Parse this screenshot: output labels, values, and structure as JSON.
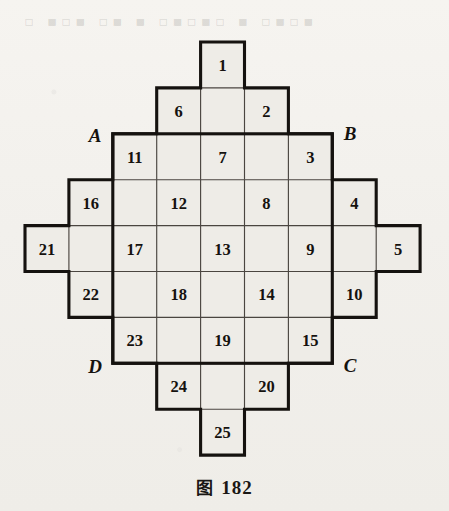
{
  "figure": {
    "caption_prefix": "图",
    "caption_number": "182",
    "ghost_text": "▫ ▪▫▪ ▫▪ ▪ ▫▪▫▪▫ ▪ ▫▪▫▪",
    "grid": {
      "columns": 9,
      "rows": 9,
      "cell_width": 43.9,
      "cell_height": 45.9,
      "origin_x": 25,
      "origin_y": 42,
      "row_spans": [
        {
          "row": 1,
          "col_start": 5,
          "col_end": 5
        },
        {
          "row": 2,
          "col_start": 4,
          "col_end": 6
        },
        {
          "row": 3,
          "col_start": 3,
          "col_end": 7
        },
        {
          "row": 4,
          "col_start": 2,
          "col_end": 8
        },
        {
          "row": 5,
          "col_start": 1,
          "col_end": 9
        },
        {
          "row": 6,
          "col_start": 2,
          "col_end": 8
        },
        {
          "row": 7,
          "col_start": 3,
          "col_end": 7
        },
        {
          "row": 8,
          "col_start": 4,
          "col_end": 6
        },
        {
          "row": 9,
          "col_start": 5,
          "col_end": 5
        }
      ]
    },
    "numbered_cells": [
      {
        "label": "1",
        "row": 1,
        "col": 5
      },
      {
        "label": "6",
        "row": 2,
        "col": 4
      },
      {
        "label": "2",
        "row": 2,
        "col": 6
      },
      {
        "label": "11",
        "row": 3,
        "col": 3
      },
      {
        "label": "7",
        "row": 3,
        "col": 5
      },
      {
        "label": "3",
        "row": 3,
        "col": 7
      },
      {
        "label": "16",
        "row": 4,
        "col": 2
      },
      {
        "label": "12",
        "row": 4,
        "col": 4
      },
      {
        "label": "8",
        "row": 4,
        "col": 6
      },
      {
        "label": "4",
        "row": 4,
        "col": 8
      },
      {
        "label": "21",
        "row": 5,
        "col": 1
      },
      {
        "label": "17",
        "row": 5,
        "col": 3
      },
      {
        "label": "13",
        "row": 5,
        "col": 5
      },
      {
        "label": "9",
        "row": 5,
        "col": 7
      },
      {
        "label": "5",
        "row": 5,
        "col": 9
      },
      {
        "label": "22",
        "row": 6,
        "col": 2
      },
      {
        "label": "18",
        "row": 6,
        "col": 4
      },
      {
        "label": "14",
        "row": 6,
        "col": 6
      },
      {
        "label": "10",
        "row": 6,
        "col": 8
      },
      {
        "label": "23",
        "row": 7,
        "col": 3
      },
      {
        "label": "19",
        "row": 7,
        "col": 5
      },
      {
        "label": "15",
        "row": 7,
        "col": 7
      },
      {
        "label": "24",
        "row": 8,
        "col": 4
      },
      {
        "label": "20",
        "row": 8,
        "col": 6
      },
      {
        "label": "25",
        "row": 9,
        "col": 5
      }
    ],
    "corner_labels": [
      {
        "label": "A",
        "x": 95,
        "y": 135
      },
      {
        "label": "B",
        "x": 350,
        "y": 133
      },
      {
        "label": "C",
        "x": 350,
        "y": 365
      },
      {
        "label": "D",
        "x": 95,
        "y": 366
      }
    ],
    "colors": {
      "ink": "#15120f",
      "cell_fill": "#eeecE7",
      "paper": "#f3f1ed",
      "thin_line": "#4a4540"
    }
  }
}
